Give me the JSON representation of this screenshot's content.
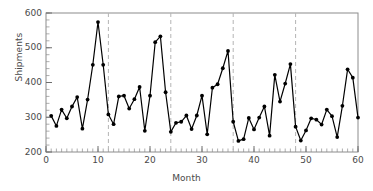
{
  "chart_data": {
    "type": "line",
    "title": "",
    "xlabel": "Month",
    "ylabel": "Shipments",
    "xlim": [
      0,
      60
    ],
    "ylim": [
      200,
      600
    ],
    "xticks": [
      0,
      10,
      20,
      30,
      40,
      50,
      60
    ],
    "yticks": [
      200,
      300,
      400,
      500,
      600
    ],
    "grid": false,
    "legend": null,
    "marker": "filled-circle",
    "line_color": "#000000",
    "marker_color": "#000000",
    "vlines": {
      "x": [
        12,
        24,
        36,
        48
      ],
      "style": "dashed",
      "color": "#b4b4b4",
      "label": "year boundary"
    },
    "x": [
      1,
      2,
      3,
      4,
      5,
      6,
      7,
      8,
      9,
      10,
      11,
      12,
      13,
      14,
      15,
      16,
      17,
      18,
      19,
      20,
      21,
      22,
      23,
      24,
      25,
      26,
      27,
      28,
      29,
      30,
      31,
      32,
      33,
      34,
      35,
      36,
      37,
      38,
      39,
      40,
      41,
      42,
      43,
      44,
      45,
      46,
      47,
      48,
      49,
      50,
      51,
      52,
      53,
      54,
      55,
      56,
      57,
      58,
      59,
      60
    ],
    "values": [
      304,
      275,
      322,
      297,
      331,
      358,
      267,
      351,
      451,
      574,
      451,
      308,
      280,
      360,
      362,
      325,
      352,
      387,
      261,
      362,
      516,
      533,
      372,
      258,
      284,
      287,
      305,
      266,
      305,
      362,
      251,
      385,
      395,
      441,
      491,
      287,
      232,
      237,
      298,
      265,
      299,
      331,
      247,
      422,
      345,
      397,
      453,
      273,
      233,
      262,
      297,
      293,
      279,
      322,
      303,
      243,
      333,
      438,
      414,
      299
    ],
    "series_name": "Shipments"
  }
}
